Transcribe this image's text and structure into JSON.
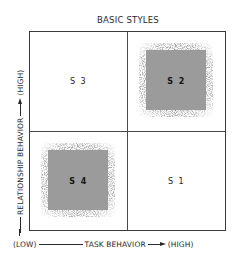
{
  "diagram": {
    "title": "BASIC STYLES",
    "quadrants": [
      {
        "id": "S3",
        "label": "S 3",
        "position": "top-left",
        "shaded": false
      },
      {
        "id": "S2",
        "label": "S 2",
        "position": "top-right",
        "shaded": true
      },
      {
        "id": "S4",
        "label": "S 4",
        "position": "bottom-left",
        "shaded": true
      },
      {
        "id": "S1",
        "label": "S 1",
        "position": "bottom-right",
        "shaded": false
      }
    ],
    "y_axis": {
      "label": "RELATIONSHIP BEHAVIOR",
      "high": "(HIGH)"
    },
    "x_axis": {
      "low": "(LOW)",
      "label": "TASK BEHAVIOR",
      "high": "(HIGH)"
    },
    "colors": {
      "line": "#3a3a3a",
      "shade": "#9b9b9b",
      "text": "#2a2a2a"
    }
  }
}
